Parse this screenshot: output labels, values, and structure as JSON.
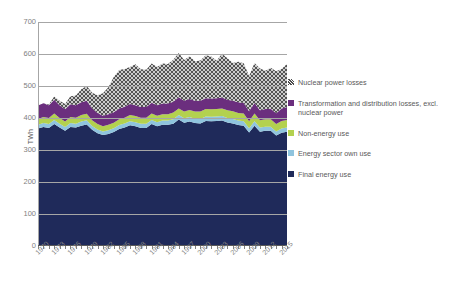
{
  "chart_data": {
    "type": "area",
    "title": "",
    "xlabel": "",
    "ylabel": "TWh",
    "ylim": [
      0,
      700
    ],
    "ytick_labels": [
      "700",
      "600",
      "500",
      "400",
      "300",
      "200",
      "100",
      "0"
    ],
    "ytick_values": [
      700,
      600,
      500,
      400,
      300,
      200,
      100,
      0
    ],
    "grid": true,
    "stacked": true,
    "legend_position": "right",
    "x": [
      1970,
      1971,
      1972,
      1973,
      1974,
      1975,
      1976,
      1977,
      1978,
      1979,
      1980,
      1981,
      1982,
      1983,
      1984,
      1985,
      1986,
      1987,
      1988,
      1989,
      1990,
      1991,
      1992,
      1993,
      1994,
      1995,
      1996,
      1997,
      1998,
      1999,
      2000,
      2001,
      2002,
      2003,
      2004,
      2005,
      2006,
      2007,
      2008,
      2009,
      2010,
      2011,
      2012,
      2013,
      2014,
      2015,
      2016
    ],
    "xtick_labels": [
      "1970",
      "1973",
      "1976",
      "1979",
      "1982",
      "1985",
      "1988",
      "1991",
      "1994",
      "1997",
      "2000",
      "2003",
      "2006",
      "2009",
      "2012",
      "2015"
    ],
    "series": [
      {
        "name": "Final energy use",
        "color": "#1F2A5A",
        "values": [
          367,
          372,
          369,
          381,
          370,
          360,
          372,
          370,
          376,
          380,
          363,
          352,
          347,
          350,
          356,
          366,
          370,
          377,
          374,
          369,
          369,
          381,
          374,
          379,
          379,
          382,
          395,
          385,
          389,
          384,
          383,
          391,
          390,
          391,
          392,
          386,
          383,
          378,
          376,
          355,
          376,
          357,
          360,
          360,
          345,
          354,
          357
        ]
      },
      {
        "name": "Energy sector own use",
        "color": "#8FC4DE",
        "values": [
          12,
          12,
          12,
          13,
          12,
          12,
          12,
          12,
          13,
          13,
          12,
          12,
          11,
          12,
          12,
          12,
          13,
          13,
          13,
          13,
          13,
          13,
          13,
          13,
          13,
          14,
          14,
          14,
          14,
          14,
          14,
          14,
          14,
          14,
          14,
          14,
          14,
          14,
          14,
          13,
          14,
          13,
          13,
          13,
          13,
          13,
          13
        ]
      },
      {
        "name": "Non-energy use",
        "color": "#B3D14F",
        "values": [
          18,
          19,
          19,
          20,
          18,
          17,
          19,
          19,
          20,
          20,
          18,
          17,
          16,
          17,
          17,
          18,
          18,
          19,
          19,
          19,
          19,
          20,
          20,
          20,
          20,
          21,
          21,
          21,
          22,
          22,
          23,
          23,
          23,
          23,
          24,
          24,
          24,
          24,
          24,
          22,
          24,
          23,
          23,
          23,
          23,
          24,
          24
        ]
      },
      {
        "name": "Transformation and distribution losses, excl. nuclear power",
        "color": "#6B2E7E",
        "values": [
          42,
          43,
          40,
          43,
          40,
          38,
          40,
          39,
          40,
          41,
          37,
          35,
          33,
          33,
          33,
          34,
          34,
          35,
          34,
          33,
          33,
          34,
          33,
          33,
          33,
          34,
          35,
          34,
          34,
          34,
          34,
          34,
          34,
          34,
          34,
          33,
          33,
          33,
          33,
          31,
          33,
          31,
          32,
          33,
          34,
          39,
          40
        ]
      },
      {
        "name": "Nuclear power losses",
        "color": "#D9D9D9",
        "hatch": "cross-hatch",
        "values": [
          0,
          0,
          2,
          10,
          14,
          17,
          25,
          30,
          41,
          46,
          49,
          55,
          70,
          84,
          110,
          120,
          118,
          115,
          128,
          118,
          117,
          122,
          119,
          125,
          124,
          131,
          138,
          127,
          134,
          123,
          126,
          134,
          131,
          117,
          137,
          130,
          118,
          127,
          124,
          110,
          125,
          131,
          120,
          128,
          131,
          123,
          135
        ]
      }
    ]
  },
  "legend": {
    "items": [
      {
        "label": "Nuclear power losses",
        "swatch": "hatched-swatch"
      },
      {
        "label": "Transformation and distribution losses, excl. nuclear power",
        "swatch": "purple-swatch"
      },
      {
        "label": "Non-energy use",
        "swatch": "green-swatch"
      },
      {
        "label": "Energy sector own use",
        "swatch": "blue-swatch"
      },
      {
        "label": "Final energy use",
        "swatch": "navy-swatch"
      }
    ]
  }
}
